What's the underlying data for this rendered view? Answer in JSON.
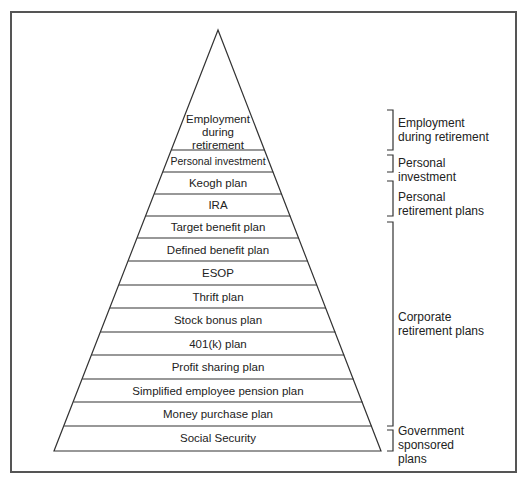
{
  "diagram": {
    "type": "pyramid",
    "tiers_top_to_bottom": [
      {
        "label_lines": [
          "Employment",
          "during",
          "retirement"
        ]
      },
      {
        "label_lines": [
          "Personal investment"
        ]
      },
      {
        "label_lines": [
          "Keogh plan"
        ]
      },
      {
        "label_lines": [
          "IRA"
        ]
      },
      {
        "label_lines": [
          "Target benefit plan"
        ]
      },
      {
        "label_lines": [
          "Defined benefit plan"
        ]
      },
      {
        "label_lines": [
          "ESOP"
        ]
      },
      {
        "label_lines": [
          "Thrift plan"
        ]
      },
      {
        "label_lines": [
          "Stock bonus plan"
        ]
      },
      {
        "label_lines": [
          "401(k) plan"
        ]
      },
      {
        "label_lines": [
          "Profit sharing plan"
        ]
      },
      {
        "label_lines": [
          "Simplified employee pension plan"
        ]
      },
      {
        "label_lines": [
          "Money purchase plan"
        ]
      },
      {
        "label_lines": [
          "Social Security"
        ]
      }
    ],
    "groups": [
      {
        "name": "Employment during retirement",
        "lines": [
          "Employment",
          "during retirement"
        ]
      },
      {
        "name": "Personal investment",
        "lines": [
          "Personal",
          "investment"
        ]
      },
      {
        "name": "Personal retirement plans",
        "lines": [
          "Personal",
          "retirement plans"
        ]
      },
      {
        "name": "Corporate retirement plans",
        "lines": [
          "Corporate",
          "retirement plans"
        ]
      },
      {
        "name": "Government sponsored plans",
        "lines": [
          "Government",
          "sponsored",
          "plans"
        ]
      }
    ],
    "colors": {
      "line": "#333333",
      "frame": "#555555",
      "background": "#ffffff"
    }
  }
}
